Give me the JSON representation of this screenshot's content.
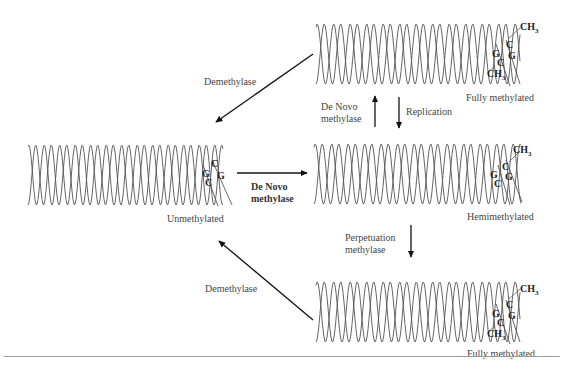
{
  "diagram": {
    "type": "DNA methylation cycle",
    "states": [
      {
        "id": "top",
        "label": "Fully methylated",
        "bases": [
          "CH3",
          "C",
          "G",
          "G",
          "C",
          "CH3"
        ]
      },
      {
        "id": "left",
        "label": "Unmethylated",
        "bases": [
          "C",
          "G",
          "G",
          "C"
        ]
      },
      {
        "id": "middle",
        "label": "Hemimethylated",
        "bases": [
          "CH3",
          "C",
          "G",
          "G",
          "C"
        ]
      },
      {
        "id": "bottom",
        "label": "Fully methylated",
        "bases": [
          "CH3",
          "C",
          "G",
          "G",
          "C",
          "CH3"
        ]
      }
    ],
    "arrows": [
      {
        "from": "top",
        "to": "left",
        "label": "Demethylase"
      },
      {
        "from": "bottom",
        "to": "left",
        "label": "Demethylase"
      },
      {
        "from": "left",
        "to": "middle",
        "label_line1": "De Novo",
        "label_line2": "methylase"
      },
      {
        "from": "middle",
        "to": "top",
        "label_line1": "De Novo",
        "label_line2": "methylase"
      },
      {
        "from": "top",
        "to": "middle",
        "label": "Replication"
      },
      {
        "from": "middle",
        "to": "bottom",
        "label_line1": "Perpetuation",
        "label_line2": "methylase"
      }
    ]
  },
  "labels": {
    "fully_methylated_top": "Fully methylated",
    "unmethylated": "Unmethylated",
    "hemimethylated": "Hemimethylated",
    "fully_methylated_bottom": "Fully methylated",
    "demethylase_top": "Demethylase",
    "demethylase_bottom": "Demethylase",
    "de_novo_1a": "De Novo",
    "de_novo_1b": "methylase",
    "de_novo_2a": "De Novo",
    "de_novo_2b": "methylase",
    "replication": "Replication",
    "perpetuation_a": "Perpetuation",
    "perpetuation_b": "methylase"
  },
  "bases": {
    "C": "C",
    "G": "G",
    "CH": "CH",
    "sub3": "3"
  }
}
